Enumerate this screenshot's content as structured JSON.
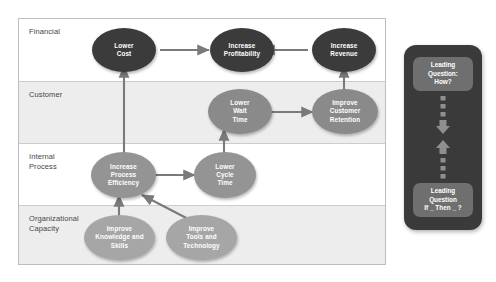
{
  "diagram": {
    "perspectives": [
      {
        "label": "Financial"
      },
      {
        "label": "Customer"
      },
      {
        "label": "Internal\nProcess"
      },
      {
        "label": "Organizational\nCapacity"
      }
    ],
    "nodes": [
      {
        "id": "lower-cost",
        "label": "Lower\nCost",
        "tier": "financial"
      },
      {
        "id": "increase-profitability",
        "label": "Increase\nProfitability",
        "tier": "financial"
      },
      {
        "id": "increase-revenue",
        "label": "Increase\nRevenue",
        "tier": "financial"
      },
      {
        "id": "lower-wait-time",
        "label": "Lower\nWait\nTime",
        "tier": "customer"
      },
      {
        "id": "improve-retention",
        "label": "Improve\nCustomer\nRetention",
        "tier": "customer"
      },
      {
        "id": "process-efficiency",
        "label": "Increase\nProcess\nEfficiency",
        "tier": "internal"
      },
      {
        "id": "lower-cycle-time",
        "label": "Lower\nCycle\nTime",
        "tier": "internal"
      },
      {
        "id": "improve-knowledge",
        "label": "Improve\nKnowledge and\nSkills",
        "tier": "capacity"
      },
      {
        "id": "improve-tools",
        "label": "Improve\nTools and\nTechnology",
        "tier": "capacity"
      }
    ]
  },
  "side_panel": {
    "leading_question_how": "Leading\nQuestion:\nHow?",
    "leading_question_if_then": "Leading\nQuestion\nIf _ Then _ ?"
  },
  "colors": {
    "financial": "#3b3b3b",
    "customer": "#8a8a8a",
    "internal": "#949494",
    "capacity": "#a6a6a6",
    "panel": "#3a3a3a",
    "callout": "#6f6f6f",
    "connector": "#7a7a7a",
    "band_alt": "#ededed"
  }
}
